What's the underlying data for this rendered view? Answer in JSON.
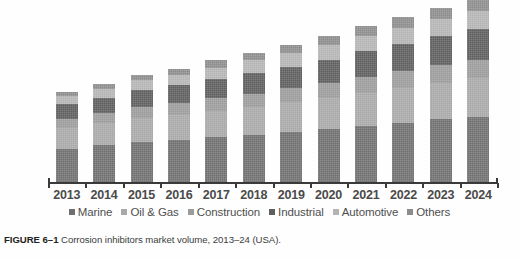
{
  "figure": {
    "caption_label": "FIGURE 6–1",
    "caption_text": "Corrosion inhibitors market volume, 2013–24 (USA)."
  },
  "chart_data": {
    "type": "bar",
    "stacked": true,
    "title": "",
    "subtitle": "",
    "xlabel": "",
    "ylabel": "",
    "grid": false,
    "legend_position": "bottom",
    "axis_visible": {
      "x": true,
      "y": false
    },
    "ylim": [
      0,
      100
    ],
    "categories": [
      "2013",
      "2014",
      "2015",
      "2016",
      "2017",
      "2018",
      "2019",
      "2020",
      "2021",
      "2022",
      "2023",
      "2024"
    ],
    "series": [
      {
        "name": "Marine",
        "color": "#6f6f6f",
        "values": [
          19.0,
          21.0,
          23.0,
          24.0,
          25.5,
          27.0,
          28.5,
          30.0,
          32.0,
          33.5,
          35.5,
          37.0
        ]
      },
      {
        "name": "Oil & Gas",
        "color": "#a8a8a8",
        "values": [
          12.0,
          12.5,
          13.5,
          14.0,
          15.0,
          15.5,
          16.5,
          17.5,
          18.5,
          19.5,
          20.5,
          21.5
        ]
      },
      {
        "name": "Construction",
        "color": "#9b9b9b",
        "values": [
          5.0,
          5.5,
          6.0,
          6.5,
          7.0,
          7.5,
          8.0,
          8.5,
          9.0,
          9.5,
          10.0,
          10.5
        ]
      },
      {
        "name": "Industrial",
        "color": "#5e5e5e",
        "values": [
          8.0,
          8.5,
          9.5,
          10.0,
          10.5,
          11.5,
          12.0,
          13.0,
          14.0,
          15.0,
          16.0,
          17.0
        ]
      },
      {
        "name": "Automotive",
        "color": "#b4b4b4",
        "values": [
          4.5,
          5.0,
          5.5,
          6.0,
          6.5,
          7.0,
          7.5,
          8.0,
          8.5,
          9.0,
          9.5,
          10.0
        ]
      },
      {
        "name": "Others",
        "color": "#8c8c8c",
        "values": [
          2.5,
          3.0,
          3.0,
          3.5,
          4.0,
          4.0,
          4.5,
          5.0,
          5.5,
          6.0,
          6.5,
          7.0
        ]
      }
    ]
  }
}
